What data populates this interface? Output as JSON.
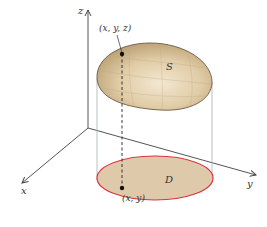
{
  "figure": {
    "type": "3d-surface-projection",
    "axes": {
      "x_label": "x",
      "y_label": "y",
      "z_label": "z"
    },
    "surface": {
      "label": "S",
      "fill_color": "#d9c6a0",
      "edge_color": "#6b5a45"
    },
    "region": {
      "label": "D",
      "fill_color": "#dfc9ab",
      "edge_color": "#d9343b"
    },
    "point_3d": {
      "label": "(x, y, z)"
    },
    "point_2d": {
      "label": "(x, y)"
    },
    "colors": {
      "axis": "#444444",
      "projection_lines": "#b0b4b8",
      "dashed_line": "#222222"
    }
  }
}
